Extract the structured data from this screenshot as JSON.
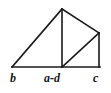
{
  "figure": {
    "type": "geometry-diagram",
    "background_color": "#ffffff",
    "stroke_color": "#1a1a1a",
    "stroke_width": 1.6,
    "canvas": {
      "width": 111,
      "height": 93
    },
    "points": {
      "b": {
        "x": 12,
        "y": 67
      },
      "apex": {
        "x": 62,
        "y": 9
      },
      "foot": {
        "x": 62,
        "y": 67
      },
      "top_right": {
        "x": 99,
        "y": 33
      },
      "c": {
        "x": 99,
        "y": 67
      }
    },
    "segments": [
      {
        "name": "baseline",
        "from": "b",
        "to": "c"
      },
      {
        "name": "left-hypotenuse",
        "from": "b",
        "to": "apex"
      },
      {
        "name": "altitude",
        "from": "apex",
        "to": "foot"
      },
      {
        "name": "upper-right-edge",
        "from": "apex",
        "to": "top_right"
      },
      {
        "name": "right-edge",
        "from": "top_right",
        "to": "c"
      },
      {
        "name": "right-diagonal",
        "from": "foot",
        "to": "top_right"
      }
    ],
    "labels": {
      "left": "b",
      "middle": "a-d",
      "right": "c"
    }
  }
}
